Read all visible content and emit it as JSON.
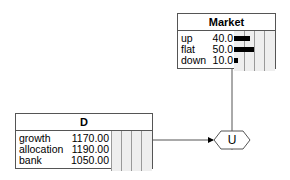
{
  "nodes": {
    "market": {
      "title": "Market",
      "states": [
        {
          "label": "up",
          "value": "40.0",
          "pct": 40
        },
        {
          "label": "flat",
          "value": "50.0",
          "pct": 50
        },
        {
          "label": "down",
          "value": "10.0",
          "pct": 10
        }
      ]
    },
    "decision": {
      "title": "D",
      "options": [
        {
          "label": "growth",
          "value": "1170.00"
        },
        {
          "label": "allocation",
          "value": "1190.00"
        },
        {
          "label": "bank",
          "value": "1050.00"
        }
      ]
    },
    "utility": {
      "label": "U"
    }
  }
}
